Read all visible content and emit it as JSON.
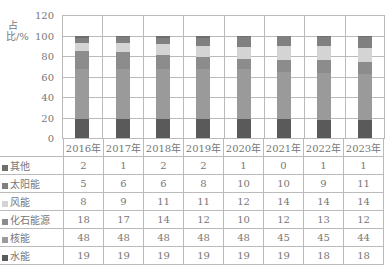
{
  "chart_data": {
    "type": "bar",
    "stacked": true,
    "title": "",
    "xlabel": "",
    "ylabel": "占比/%",
    "ylim": [
      0,
      120
    ],
    "yticks": [
      "120",
      "100",
      "80",
      "60",
      "40",
      "20",
      "0"
    ],
    "grid": true,
    "categories": [
      "2016年",
      "2017年",
      "2018年",
      "2019年",
      "2020年",
      "2021年",
      "2022年",
      "2023年"
    ],
    "series": [
      {
        "name": "水能",
        "color": "#5a5a5a",
        "values": [
          19,
          19,
          19,
          19,
          19,
          19,
          18,
          18
        ]
      },
      {
        "name": "核能",
        "color": "#9a9a9a",
        "values": [
          48,
          48,
          48,
          48,
          48,
          45,
          45,
          44
        ]
      },
      {
        "name": "化石能源",
        "color": "#8c8c8c",
        "values": [
          18,
          17,
          14,
          12,
          10,
          12,
          13,
          12
        ]
      },
      {
        "name": "风能",
        "color": "#d4d4d4",
        "values": [
          8,
          9,
          11,
          11,
          12,
          14,
          14,
          14
        ]
      },
      {
        "name": "太阳能",
        "color": "#808080",
        "values": [
          5,
          6,
          6,
          8,
          10,
          10,
          9,
          11
        ]
      },
      {
        "name": "其他",
        "color": "#6e6e6e",
        "values": [
          2,
          1,
          2,
          2,
          1,
          0,
          1,
          1
        ]
      }
    ],
    "table_row_order": [
      "其他",
      "太阳能",
      "风能",
      "化石能源",
      "核能",
      "水能"
    ],
    "legend_position": "data-table-left"
  }
}
